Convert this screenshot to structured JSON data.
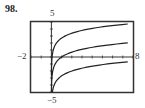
{
  "problem_number": "98.",
  "chart_data": {
    "type": "line",
    "title": "",
    "xlabel": "",
    "ylabel": "",
    "xlim": [
      -2,
      8
    ],
    "ylim": [
      -5,
      5
    ],
    "x_tick_labels": [
      "-2",
      "8"
    ],
    "y_tick_labels": [
      "5",
      "-5"
    ],
    "grid": false,
    "series": [
      {
        "name": "upper curve",
        "formula": "ln(x) + 2.7",
        "x": [
          0.05,
          0.25,
          0.5,
          1,
          2,
          4,
          7.7
        ],
        "values": [
          -0.3,
          1.3,
          2.0,
          2.7,
          3.4,
          4.1,
          4.7
        ]
      },
      {
        "name": "middle curve",
        "formula": "ln(x)",
        "x": [
          0.05,
          0.25,
          0.5,
          1,
          2,
          4,
          7.7
        ],
        "values": [
          -3.0,
          -1.4,
          -0.7,
          0.0,
          0.7,
          1.4,
          2.0
        ]
      },
      {
        "name": "lower curve",
        "formula": "ln(x) - 2.7",
        "x": [
          0.05,
          0.25,
          0.5,
          1,
          2,
          4,
          7.7
        ],
        "values": [
          -5.0,
          -4.1,
          -3.4,
          -2.7,
          -2.0,
          -1.3,
          -0.7
        ]
      }
    ]
  },
  "labels": {
    "y_max": "5",
    "y_min": "−5",
    "x_min": "−2",
    "x_max": "8"
  }
}
